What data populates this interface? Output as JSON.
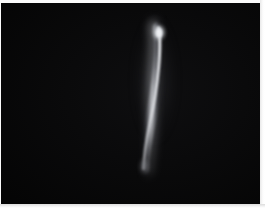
{
  "image": {
    "title": "Bright vertical streak on black background",
    "width": 265,
    "height": 208,
    "kind": "photograph",
    "background_color": "#040404",
    "border_color": "#fbfbfb",
    "caption": ""
  },
  "subject": {
    "name": "light-streak",
    "description": "Slender, slightly curved vertical luminous streak, rounded bright tip at top, tapering and dimming toward the bottom",
    "orientation": "near-vertical, tilted left-of-vertical going downward",
    "core_color": "#d8dade",
    "mid_color": "#9b9da4",
    "edge_color": "#2a2b2e",
    "top_tip": {
      "x": 158,
      "y": 27
    },
    "bottom_tip": {
      "x": 145,
      "y": 168
    },
    "length_px": 141,
    "max_width_px": 10,
    "brightest_region": "upper third"
  },
  "frame": {
    "right_edge_width": 5,
    "bottom_edge_height": 4,
    "top_edge_height": 3,
    "left_edge_width": 1
  }
}
